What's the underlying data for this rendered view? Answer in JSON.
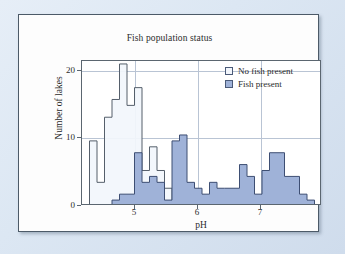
{
  "figure": {
    "title": "Fish population status",
    "background_color": "#dce7f3",
    "card_color": "#fdfdfd"
  },
  "legend": {
    "position": "top-right",
    "items": [
      {
        "label": "No fish present",
        "swatch": "nofish",
        "color": "#f2f6fc"
      },
      {
        "label": "Fish present",
        "swatch": "fish",
        "color": "#9fb2d8"
      }
    ]
  },
  "axes": {
    "x": {
      "label": "pH",
      "ticks": [
        "5",
        "6",
        "7"
      ],
      "tick_values": [
        5,
        6,
        7
      ],
      "range": [
        4.25,
        7.45
      ]
    },
    "y": {
      "label": "Number of lakes",
      "ticks": [
        "0",
        "10",
        "20"
      ],
      "tick_values": [
        0,
        10,
        20
      ],
      "range": [
        0,
        24.5
      ]
    }
  },
  "chart_data": {
    "type": "bar",
    "subtype": "overlaid-histogram",
    "title": "Fish population status",
    "xlabel": "pH",
    "ylabel": "Number of lakes",
    "xlim": [
      4.25,
      7.45
    ],
    "ylim": [
      0,
      24.5
    ],
    "grid": true,
    "legend_position": "top-right",
    "bin_width": 0.1,
    "bin_starts": [
      4.35,
      4.45,
      4.55,
      4.65,
      4.75,
      4.85,
      4.95,
      5.05,
      5.15,
      5.25,
      5.35,
      5.45,
      5.55,
      5.65,
      5.75,
      5.85,
      5.95,
      6.05,
      6.15,
      6.25,
      6.35,
      6.45,
      6.55,
      6.65,
      6.75,
      6.85,
      6.95,
      7.05,
      7.15,
      7.25
    ],
    "categories": [
      "4.35",
      "4.45",
      "4.55",
      "4.65",
      "4.75",
      "4.85",
      "4.95",
      "5.05",
      "5.15",
      "5.25",
      "5.35",
      "5.45",
      "5.55",
      "5.65",
      "5.75",
      "5.85",
      "5.95",
      "6.05",
      "6.15",
      "6.25",
      "6.35",
      "6.45",
      "6.55",
      "6.65",
      "6.75",
      "6.85",
      "6.95",
      "7.05",
      "7.15",
      "7.25"
    ],
    "series": [
      {
        "name": "No fish present",
        "color": "#f2f6fc",
        "edge_color": "#555f6b",
        "values": [
          11,
          4,
          15,
          18,
          24,
          17,
          20,
          6,
          10,
          6,
          3,
          1,
          0,
          0,
          0,
          0,
          0,
          0,
          0,
          0,
          0,
          0,
          0,
          0,
          0,
          0,
          0,
          0,
          0,
          0
        ]
      },
      {
        "name": "Fish present",
        "color": "#9fb2d8",
        "edge_color": "#3d4e73",
        "values": [
          0,
          0,
          0,
          1,
          2,
          2,
          9,
          4,
          5,
          4,
          1,
          11,
          12,
          4,
          3,
          2,
          4,
          3,
          3,
          3,
          7,
          5,
          2,
          6,
          9,
          9,
          5,
          5,
          2,
          1
        ]
      }
    ]
  }
}
